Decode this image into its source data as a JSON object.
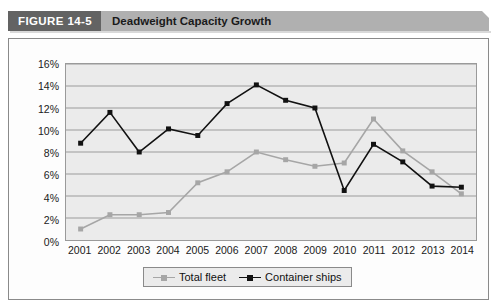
{
  "figure": {
    "tag": "FIGURE 14-5",
    "title": "Deadweight Capacity Growth"
  },
  "colors": {
    "tag_background": "#636363",
    "title_background": "#b0b0b0",
    "plot_background": "#ebebeb",
    "total_fleet": "#a6a6a6",
    "container_ships": "#111111",
    "gridline": "#9a9a9a"
  },
  "chart_data": {
    "type": "line",
    "title": "Deadweight Capacity Growth",
    "xlabel": "",
    "ylabel": "",
    "grid": true,
    "legend_position": "bottom",
    "ylim": [
      0,
      16
    ],
    "ytick_labels": [
      "0%",
      "2%",
      "4%",
      "6%",
      "8%",
      "10%",
      "12%",
      "14%",
      "16%"
    ],
    "ytick_values": [
      0,
      2,
      4,
      6,
      8,
      10,
      12,
      14,
      16
    ],
    "categories": [
      "2001",
      "2002",
      "2003",
      "2004",
      "2005",
      "2006",
      "2007",
      "2008",
      "2009",
      "2010",
      "2011",
      "2012",
      "2013",
      "2014"
    ],
    "series": [
      {
        "name": "Total fleet",
        "color": "#a6a6a6",
        "values": [
          1.0,
          2.3,
          2.3,
          2.5,
          5.2,
          6.2,
          8.0,
          7.3,
          6.7,
          7.0,
          11.0,
          8.1,
          6.2,
          4.2
        ]
      },
      {
        "name": "Container ships",
        "color": "#111111",
        "values": [
          8.8,
          11.6,
          8.0,
          10.1,
          9.5,
          12.4,
          14.1,
          12.7,
          12.0,
          4.5,
          8.7,
          7.1,
          4.9,
          4.8
        ]
      }
    ]
  }
}
